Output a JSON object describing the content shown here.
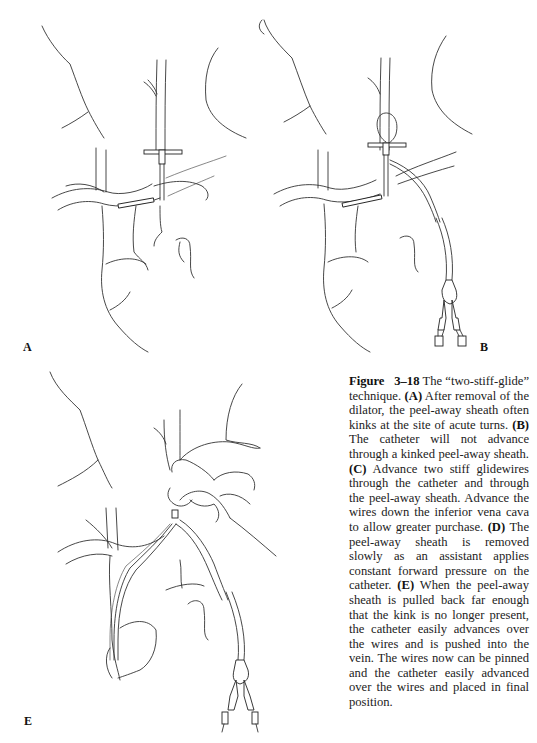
{
  "figure": {
    "panels": [
      {
        "id": "A",
        "label": "A"
      },
      {
        "id": "B",
        "label": "B"
      },
      {
        "id": "E",
        "label": "E"
      }
    ],
    "caption": {
      "figure_word": "Figure",
      "figure_number": "3–18",
      "title": "The “two-stiff-glide” technique.",
      "parts": [
        {
          "key": "(A)",
          "text": "After removal of the dilator, the peel-away sheath often kinks at the site of acute turns."
        },
        {
          "key": "(B)",
          "text": "The catheter will not advance through a kinked peel-away sheath."
        },
        {
          "key": "(C)",
          "text": "Advance two stiff glidewires through the catheter and through the peel-away sheath. Advance the wires down the inferior vena cava to allow greater purchase."
        },
        {
          "key": "(D)",
          "text": "The peel-away sheath is removed slowly as an assistant applies constant forward pressure on the catheter."
        },
        {
          "key": "(E)",
          "text": "When the peel-away sheath is pulled back far enough that the kink is no longer present, the catheter easily advances over the wires and is pushed into the vein. The wires now can be pinned and the catheter easily advanced over the wires and placed in final position."
        }
      ]
    }
  }
}
